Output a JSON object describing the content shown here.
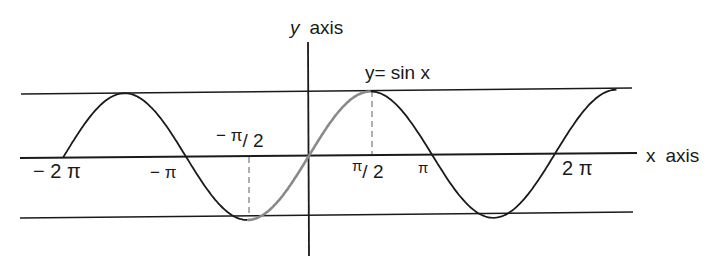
{
  "diagram": {
    "y_axis_label": {
      "var": "y",
      "word": "axis"
    },
    "x_axis_label": {
      "var": "x",
      "word": "axis"
    },
    "curve_label": "y= sin x",
    "tick_labels": {
      "neg_two_pi": "− 2 π",
      "neg_pi": "− π",
      "neg_half_pi_main": "− π",
      "neg_half_pi_den": "/ 2",
      "half_pi_main": "π",
      "half_pi_den": "/ 2",
      "pi": "π",
      "two_pi": "2 π"
    },
    "highlight": "Segment from −π/2 to π/2 drawn in gray",
    "colors": {
      "curve": "#1a1a1a",
      "highlight": "#8a8a8a",
      "axes": "#1a1a1a",
      "dashed": "#7a7a7a"
    }
  },
  "chart_data": {
    "type": "line",
    "xlabel": "x axis",
    "ylabel": "y axis",
    "x_ticks": [
      "−2π",
      "−π",
      "−π/2",
      "π/2",
      "π",
      "2π"
    ],
    "xlim": [
      "−2π",
      "5π/2"
    ],
    "ylim": [
      -1,
      1
    ],
    "series": [
      {
        "name": "sin x",
        "x_range": [
          "−2π",
          "5π/2"
        ],
        "function": "sin(x)"
      },
      {
        "name": "sin x (principal branch, gray)",
        "x_range": [
          "−π/2",
          "π/2"
        ],
        "function": "sin(x)"
      }
    ],
    "reference_lines": [
      "y = 1",
      "y = −1",
      "x = −π/2 (dashed)",
      "x = π/2 (dashed)"
    ]
  }
}
